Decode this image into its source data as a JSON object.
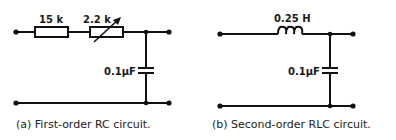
{
  "diagrams": [
    {
      "id": "a",
      "caption": "(a) First-order RC circuit.",
      "components": [
        {
          "type": "resistor",
          "label": "15 k"
        },
        {
          "type": "variable-resistor",
          "label": "2.2 k"
        },
        {
          "type": "capacitor",
          "label": "0.1μF"
        }
      ]
    },
    {
      "id": "b",
      "caption": "(b) Second-order RLC circuit.",
      "components": [
        {
          "type": "inductor",
          "label": "0.25 H"
        },
        {
          "type": "capacitor",
          "label": "0.1μF"
        }
      ]
    }
  ]
}
